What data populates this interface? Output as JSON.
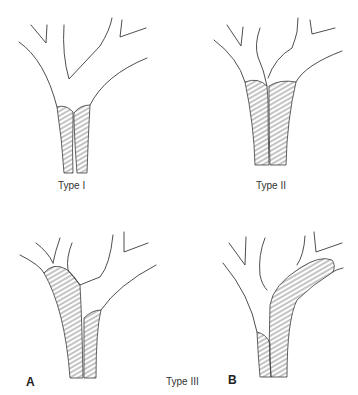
{
  "figure": {
    "panels": [
      {
        "id": "type-1",
        "label": "Type I"
      },
      {
        "id": "type-2",
        "label": "Type II"
      },
      {
        "id": "type-3a",
        "label": "Type III",
        "letter": "A"
      },
      {
        "id": "type-3b",
        "letter": "B"
      }
    ],
    "shared_label": "Type III",
    "colors": {
      "line": "#3a3a3a",
      "hatch": "#555555",
      "background": "#ffffff"
    }
  }
}
